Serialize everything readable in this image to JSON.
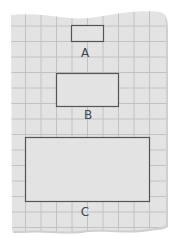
{
  "diagram": {
    "paper": {
      "fill": "#e3e3e3",
      "grid_color": "#c2c2c2",
      "edge_shadow": "#bdbdbd",
      "grid_spacing_px": 15.5
    },
    "shapes": [
      {
        "id": "A",
        "label": "A",
        "x": 71,
        "y": 25,
        "w": 32,
        "h": 16,
        "stroke": "#555555"
      },
      {
        "id": "B",
        "label": "B",
        "x": 56,
        "y": 73,
        "w": 62,
        "h": 33,
        "stroke": "#555555"
      },
      {
        "id": "C",
        "label": "C",
        "x": 25,
        "y": 137,
        "w": 124,
        "h": 64,
        "stroke": "#555555"
      }
    ],
    "labels": [
      {
        "text": "A",
        "x": 75,
        "y": 47
      },
      {
        "text": "B",
        "x": 78,
        "y": 109
      },
      {
        "text": "C",
        "x": 75,
        "y": 206
      }
    ]
  }
}
